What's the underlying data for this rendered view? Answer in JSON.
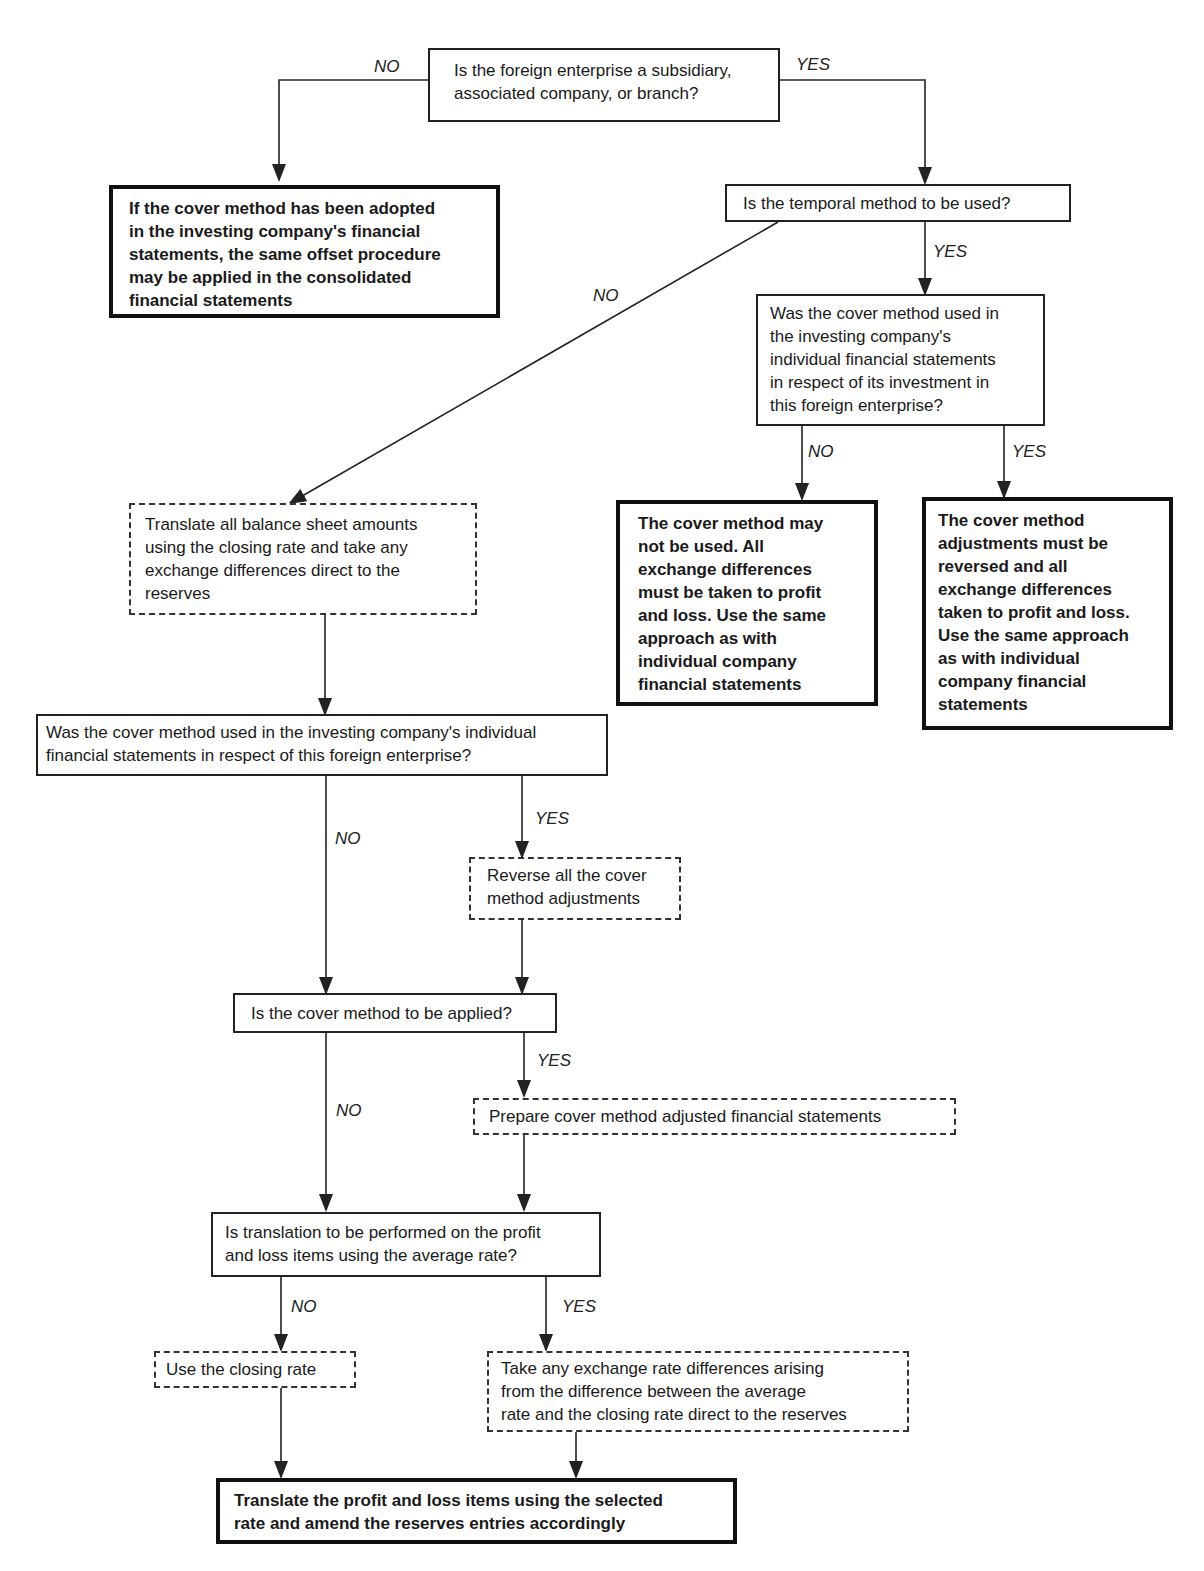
{
  "nodes": {
    "q1": {
      "text": "Is the foreign enterprise a subsidiary,\nassociated company, or branch?"
    },
    "r_no_q1": {
      "text": "If the cover method has been adopted\nin the investing company's financial\nstatements, the same offset procedure\nmay be applied in the consolidated\nfinancial statements"
    },
    "q2": {
      "text": "Is the temporal method to be used?"
    },
    "q3": {
      "text": "Was the cover method used in\nthe investing company's\nindividual financial statements\nin respect of its investment in\nthis foreign enterprise?"
    },
    "r_q3_no": {
      "text": "The cover method may\nnot be used.  All\nexchange differences\nmust be taken to profit\nand loss.  Use the same\napproach as with\nindividual company\nfinancial statements"
    },
    "r_q3_yes": {
      "text": "The cover method\nadjustments must be\nreversed and all\nexchange differences\ntaken to profit and loss.\nUse the same approach\nas with individual\ncompany financial\nstatements"
    },
    "a_translate_bs": {
      "text": "Translate all balance sheet amounts\nusing the closing rate and take any\nexchange differences direct to the\nreserves"
    },
    "q4": {
      "text": "Was the cover method used in the investing company's individual\nfinancial statements in respect of this foreign enterprise?"
    },
    "a_reverse": {
      "text": "Reverse all the cover\nmethod adjustments"
    },
    "q5": {
      "text": "Is the cover method to be applied?"
    },
    "a_prepare": {
      "text": "Prepare cover method adjusted financial statements"
    },
    "q6": {
      "text": "Is translation to be performed on the profit\nand loss items using the average rate?"
    },
    "a_closing": {
      "text": "Use the closing rate"
    },
    "a_take_diff": {
      "text": "Take any exchange rate differences arising\nfrom the difference between the average\nrate and the closing rate direct to the reserves"
    },
    "r_final": {
      "text": "Translate the profit and loss items using the selected\nrate and amend the reserves entries accordingly"
    }
  },
  "labels": {
    "q1_no": "NO",
    "q1_yes": "YES",
    "q2_no": "NO",
    "q2_yes": "YES",
    "q3_no": "NO",
    "q3_yes": "YES",
    "q4_no": "NO",
    "q4_yes": "YES",
    "q5_no": "NO",
    "q5_yes": "YES",
    "q6_no": "NO",
    "q6_yes": "YES"
  },
  "legend": {
    "question_style": "solid thin border",
    "action_style": "dashed border",
    "result_style": "thick bold border"
  },
  "colors": {
    "line": "#222222",
    "background": "#ffffff",
    "text": "#1a1a1a"
  }
}
